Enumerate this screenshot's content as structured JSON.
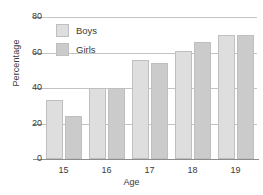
{
  "chart_data": {
    "type": "bar",
    "title": "",
    "xlabel": "Age",
    "ylabel": "Percentage",
    "categories": [
      "15",
      "16",
      "17",
      "18",
      "19"
    ],
    "series": [
      {
        "name": "Boys",
        "values": [
          33,
          40,
          56,
          61,
          70
        ],
        "color": "#dedede"
      },
      {
        "name": "Girls",
        "values": [
          24,
          40,
          54,
          66,
          70
        ],
        "color": "#cbcbcb"
      }
    ],
    "ylim": [
      0,
      80
    ],
    "yticks": [
      "0",
      "20",
      "40",
      "60",
      "80"
    ],
    "ytick_values": [
      0,
      20,
      40,
      60,
      80
    ],
    "grid": true,
    "legend_position": "upper-left-inside"
  },
  "legend": {
    "entries": [
      {
        "label": "Boys"
      },
      {
        "label": "Girls"
      }
    ]
  }
}
